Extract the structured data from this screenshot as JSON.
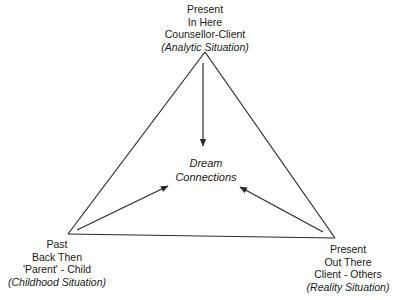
{
  "diagram": {
    "type": "triangle-relationship-diagram",
    "colors": {
      "background": "#ffffff",
      "stroke": "#2a2a2a",
      "text": "#1a1a1a"
    },
    "center": {
      "lines": [
        "Dream",
        "Connections"
      ]
    },
    "vertices": {
      "top": {
        "lines": [
          "Present",
          "In Here",
          "Counsellor-Client"
        ],
        "situation": "(Analytic Situation)"
      },
      "bottom_left": {
        "lines": [
          "Past",
          "Back Then",
          "'Parent' - Child"
        ],
        "situation": "(Childhood Situation)"
      },
      "bottom_right": {
        "lines": [
          "Present",
          "Out There",
          "Client - Others"
        ],
        "situation": "(Reality Situation)"
      }
    },
    "edges": [
      {
        "from": "top",
        "to": "bottom_left"
      },
      {
        "from": "top",
        "to": "bottom_right"
      },
      {
        "from": "bottom_left",
        "to": "bottom_right"
      }
    ],
    "arrows": [
      {
        "from": "top",
        "to": "center"
      },
      {
        "from": "bottom_left",
        "to": "center"
      },
      {
        "from": "bottom_right",
        "to": "center"
      }
    ]
  }
}
